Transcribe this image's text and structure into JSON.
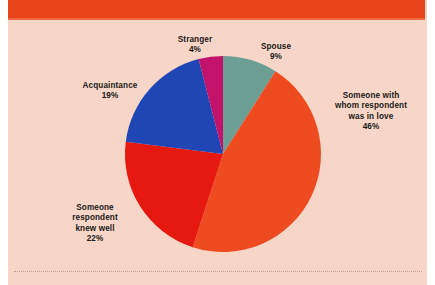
{
  "figure": {
    "background_color": "#f7d6c7",
    "banner_color": "#e8451d",
    "page_color": "#ffffff",
    "rule_color": "#c79c8e"
  },
  "chart_data": {
    "type": "pie",
    "title": "",
    "subtitle": "",
    "xlabel": "",
    "ylabel": "",
    "legend_position": "none",
    "grid": false,
    "start_angle_deg": 0,
    "direction": "clockwise",
    "categories": [
      "Spouse",
      "Someone with whom respondent was in love",
      "Someone respondent knew well",
      "Acquaintance",
      "Stranger"
    ],
    "values": [
      9,
      46,
      22,
      19,
      4
    ],
    "value_unit": "%",
    "colors": [
      "#6d9e94",
      "#ef4b21",
      "#e5190f",
      "#1f46b4",
      "#c2126b"
    ],
    "slices": [
      {
        "name": "Spouse",
        "label": "Spouse",
        "value": 9,
        "value_label": "9%",
        "color": "#6d9e94"
      },
      {
        "name": "Someone with whom respondent was in love",
        "label": "Someone with\nwhom respondent\nwas in love",
        "value": 46,
        "value_label": "46%",
        "color": "#ef4b21"
      },
      {
        "name": "Someone respondent knew well",
        "label": "Someone\nrespondent\nknew well",
        "value": 22,
        "value_label": "22%",
        "color": "#e5190f"
      },
      {
        "name": "Acquaintance",
        "label": "Acquaintance",
        "value": 19,
        "value_label": "19%",
        "color": "#1f46b4"
      },
      {
        "name": "Stranger",
        "label": "Stranger",
        "value": 4,
        "value_label": "4%",
        "color": "#c2126b"
      }
    ]
  },
  "labels": {
    "stranger": {
      "text": "Stranger",
      "pct": "4%"
    },
    "spouse": {
      "text": "Spouse",
      "pct": "9%"
    },
    "love": {
      "text": "Someone with\nwhom respondent\nwas in love",
      "pct": "46%"
    },
    "acquaintance": {
      "text": "Acquaintance",
      "pct": "19%"
    },
    "knew_well": {
      "text": "Someone\nrespondent\nknew well",
      "pct": "22%"
    }
  }
}
